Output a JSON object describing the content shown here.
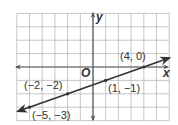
{
  "chart_data": {
    "type": "line",
    "title": "",
    "xlabel": "x",
    "ylabel": "y",
    "origin_label": "O",
    "xlim": [
      -6,
      6
    ],
    "ylim": [
      -4,
      4
    ],
    "grid": true,
    "grid_step": 1,
    "series": [
      {
        "name": "line",
        "equation": "y = (1/3)x - 4/3",
        "points": [
          {
            "x": -5,
            "y": -3,
            "label": "(−5, −3)"
          },
          {
            "x": -2,
            "y": -2,
            "label": "(−2, −2)"
          },
          {
            "x": 1,
            "y": -1,
            "label": "(1, −1)"
          },
          {
            "x": 4,
            "y": 0,
            "label": "(4, 0)"
          }
        ]
      }
    ]
  },
  "colors": {
    "grid": "#b8b8b8",
    "axis": "#444444",
    "line": "#333333",
    "text": "#333333",
    "background": "#ffffff"
  }
}
